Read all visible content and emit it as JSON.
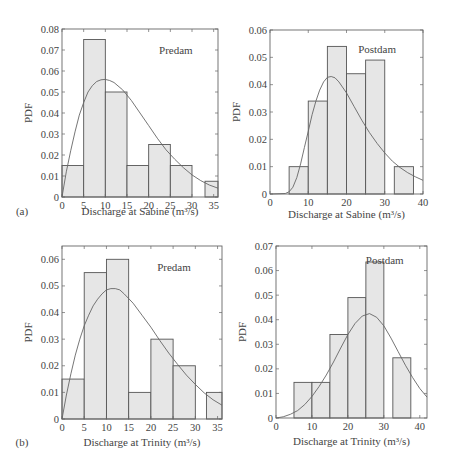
{
  "chart_data": [
    {
      "id": "a-predam",
      "type": "bar",
      "panel_label": "(a)",
      "title": "",
      "annotation": "Predam",
      "xlabel": "Discharge at Sabine (m³/s)",
      "ylabel": "PDF",
      "xlim": [
        0,
        36
      ],
      "ylim": [
        0,
        0.08
      ],
      "xticks": [
        0,
        5,
        10,
        15,
        20,
        25,
        30,
        35
      ],
      "yticks": [
        0,
        0.01,
        0.02,
        0.03,
        0.04,
        0.05,
        0.06,
        0.07,
        0.08
      ],
      "ytick_labels": [
        "0",
        "0.01",
        "0.02",
        "0.03",
        "0.04",
        "0.05",
        "0.06",
        "0.07",
        "0.08"
      ],
      "bins": [
        [
          0,
          5
        ],
        [
          5,
          10
        ],
        [
          10,
          15
        ],
        [
          15,
          20
        ],
        [
          20,
          25
        ],
        [
          25,
          30
        ],
        [
          33,
          36
        ]
      ],
      "values": [
        0.015,
        0.075,
        0.05,
        0.015,
        0.025,
        0.015,
        0.0075
      ],
      "fit_curve": {
        "x": [
          0,
          1,
          2,
          3,
          4,
          5,
          6,
          7,
          8,
          9,
          10,
          11,
          12,
          14,
          16,
          18,
          20,
          22,
          24,
          26,
          28,
          30,
          32,
          34,
          36
        ],
        "y": [
          0,
          0.012,
          0.022,
          0.031,
          0.039,
          0.045,
          0.05,
          0.053,
          0.055,
          0.0558,
          0.056,
          0.0555,
          0.0545,
          0.051,
          0.046,
          0.04,
          0.034,
          0.028,
          0.0225,
          0.018,
          0.014,
          0.0105,
          0.0078,
          0.0057,
          0.0042
        ]
      },
      "grid": false
    },
    {
      "id": "a-postdam",
      "type": "bar",
      "annotation": "Postdam",
      "xlabel": "Discharge at Sabine (m³/s)",
      "ylabel": "PDF",
      "xlim": [
        0,
        40
      ],
      "ylim": [
        0,
        0.06
      ],
      "xticks": [
        0,
        10,
        20,
        30,
        40
      ],
      "yticks": [
        0,
        0.01,
        0.02,
        0.03,
        0.04,
        0.05,
        0.06
      ],
      "ytick_labels": [
        "0",
        "0.01",
        "0.02",
        "0.03",
        "0.04",
        "0.05",
        "0.06"
      ],
      "bins": [
        [
          5,
          10
        ],
        [
          10,
          15
        ],
        [
          15,
          20
        ],
        [
          20,
          25
        ],
        [
          25,
          30
        ],
        [
          32.5,
          37.5
        ]
      ],
      "values": [
        0.01,
        0.034,
        0.054,
        0.044,
        0.049,
        0.01
      ],
      "fit_curve": {
        "x": [
          0,
          4,
          5,
          6,
          7,
          8,
          9,
          10,
          11,
          12,
          13,
          14,
          15,
          16,
          17,
          18,
          20,
          22,
          24,
          26,
          28,
          30,
          32,
          34,
          36,
          38,
          40
        ],
        "y": [
          0,
          0.0002,
          0.0008,
          0.0025,
          0.006,
          0.011,
          0.017,
          0.023,
          0.029,
          0.034,
          0.038,
          0.041,
          0.0427,
          0.043,
          0.0425,
          0.041,
          0.037,
          0.032,
          0.027,
          0.0225,
          0.0185,
          0.015,
          0.012,
          0.0097,
          0.0078,
          0.0063,
          0.005
        ]
      },
      "grid": false
    },
    {
      "id": "b-predam",
      "type": "bar",
      "panel_label": "(b)",
      "annotation": "Predam",
      "xlabel": "Discharge at Trinity (m³/s)",
      "ylabel": "PDF",
      "xlim": [
        0,
        36
      ],
      "ylim": [
        0,
        0.065
      ],
      "xticks": [
        0,
        5,
        10,
        15,
        20,
        25,
        30,
        35
      ],
      "yticks": [
        0,
        0.01,
        0.02,
        0.03,
        0.04,
        0.05,
        0.06
      ],
      "ytick_labels": [
        "0",
        "0.01",
        "0.02",
        "0.03",
        "0.04",
        "0.05",
        "0.06"
      ],
      "bins": [
        [
          0,
          5
        ],
        [
          5,
          10
        ],
        [
          10,
          15
        ],
        [
          15,
          20
        ],
        [
          20,
          25
        ],
        [
          25,
          30
        ],
        [
          32.5,
          36
        ]
      ],
      "values": [
        0.015,
        0.055,
        0.06,
        0.01,
        0.03,
        0.02,
        0.01
      ],
      "fit_curve": {
        "x": [
          0,
          1,
          2,
          3,
          4,
          5,
          6,
          7,
          8,
          9,
          10,
          11,
          12,
          13,
          14,
          16,
          18,
          20,
          22,
          24,
          26,
          28,
          30,
          32,
          34,
          36
        ],
        "y": [
          0,
          0.009,
          0.017,
          0.024,
          0.03,
          0.035,
          0.039,
          0.0425,
          0.045,
          0.047,
          0.0485,
          0.049,
          0.049,
          0.0485,
          0.047,
          0.0435,
          0.039,
          0.0345,
          0.0295,
          0.0248,
          0.0205,
          0.0165,
          0.013,
          0.0098,
          0.0072,
          0.0052
        ]
      },
      "grid": false
    },
    {
      "id": "b-postdam",
      "type": "bar",
      "annotation": "Postdam",
      "xlabel": "Discharge at Trinity (m³/s)",
      "ylabel": "PDF",
      "xlim": [
        0,
        42
      ],
      "ylim": [
        0,
        0.07
      ],
      "xticks": [
        0,
        10,
        20,
        30,
        40
      ],
      "yticks": [
        0,
        0.01,
        0.02,
        0.03,
        0.04,
        0.05,
        0.06,
        0.07
      ],
      "ytick_labels": [
        "0",
        "0.01",
        "0.02",
        "0.03",
        "0.04",
        "0.05",
        "0.06",
        "0.07"
      ],
      "bins": [
        [
          5,
          10
        ],
        [
          10,
          15
        ],
        [
          15,
          20
        ],
        [
          20,
          25
        ],
        [
          25,
          30
        ],
        [
          32.5,
          37.5
        ]
      ],
      "values": [
        0.0145,
        0.0145,
        0.034,
        0.049,
        0.0635,
        0.0245
      ],
      "fit_curve": {
        "x": [
          0,
          2,
          4,
          6,
          8,
          10,
          12,
          14,
          16,
          18,
          20,
          22,
          24,
          26,
          28,
          30,
          32,
          34,
          36,
          38,
          40,
          42
        ],
        "y": [
          0,
          0.0005,
          0.0015,
          0.003,
          0.0055,
          0.0088,
          0.0128,
          0.0175,
          0.0228,
          0.0285,
          0.034,
          0.0385,
          0.0415,
          0.0425,
          0.041,
          0.0375,
          0.0325,
          0.027,
          0.0215,
          0.0165,
          0.012,
          0.0085
        ]
      },
      "grid": false
    }
  ],
  "panels": {
    "a_label": "(a)",
    "b_label": "(b)"
  },
  "colors": {
    "bar_fill": "#e6e6e6",
    "bar_edge": "#555555",
    "curve": "#666666",
    "axis": "#666666"
  }
}
